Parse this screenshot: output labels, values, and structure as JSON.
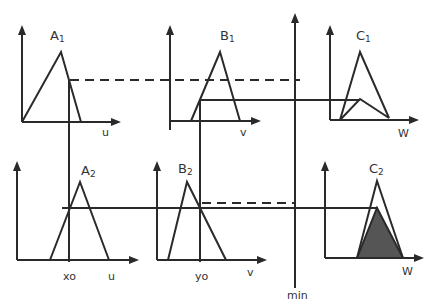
{
  "diagram": {
    "rule1": {
      "antecedent_a": {
        "label": "A",
        "sub": "1",
        "axis": "u"
      },
      "antecedent_b": {
        "label": "B",
        "sub": "1",
        "axis": "v"
      },
      "consequent": {
        "label": "C",
        "sub": "1",
        "axis": "W"
      }
    },
    "rule2": {
      "antecedent_a": {
        "label": "A",
        "sub": "2",
        "axis": "u",
        "input": "xo"
      },
      "antecedent_b": {
        "label": "B",
        "sub": "2",
        "axis": "v",
        "input": "yo"
      },
      "consequent": {
        "label": "C",
        "sub": "2",
        "axis": "W"
      }
    },
    "operator_label": "min",
    "colors": {
      "stroke": "#2a2a2a",
      "fill": "#555555",
      "background": "#ffffff"
    }
  }
}
